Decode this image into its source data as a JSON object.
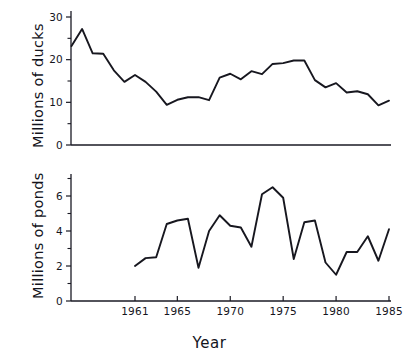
{
  "figure": {
    "background": "#ffffff",
    "ink_color": "#17171f",
    "xlabel": "Year",
    "panels": [
      "ducks",
      "ponds"
    ]
  },
  "chart_data": [
    {
      "type": "line",
      "panel": "top",
      "title": "",
      "xlabel": "",
      "ylabel": "Millions of ducks",
      "xlim": [
        1955,
        1985
      ],
      "ylim": [
        0,
        30
      ],
      "ytick_labels": [
        "0",
        "10",
        "20",
        "30"
      ],
      "yticks": [
        0,
        10,
        20,
        30
      ],
      "yticks_minor": [
        5,
        15,
        25
      ],
      "xtick_labels": [
        "1961",
        "1965",
        "1970",
        "1975",
        "1980",
        "1985"
      ],
      "xticks": [
        1961,
        1965,
        1970,
        1975,
        1980,
        1985
      ],
      "grid": false,
      "legend": false,
      "series": [
        {
          "name": "Millions of ducks",
          "x": [
            1955,
            1956,
            1957,
            1958,
            1959,
            1960,
            1961,
            1962,
            1963,
            1964,
            1965,
            1966,
            1967,
            1968,
            1969,
            1970,
            1971,
            1972,
            1973,
            1974,
            1975,
            1976,
            1977,
            1978,
            1979,
            1980,
            1981,
            1982,
            1983,
            1984,
            1985
          ],
          "values": [
            23.2,
            27.2,
            21.5,
            21.4,
            17.5,
            14.8,
            16.4,
            14.8,
            12.5,
            9.4,
            10.6,
            11.2,
            11.2,
            10.5,
            15.8,
            16.7,
            15.4,
            17.3,
            16.6,
            19.0,
            19.2,
            19.8,
            19.8,
            15.2,
            13.5,
            14.5,
            12.3,
            12.6,
            11.9,
            9.3,
            10.4
          ]
        }
      ]
    },
    {
      "type": "line",
      "panel": "bottom",
      "title": "",
      "xlabel": "Year",
      "ylabel": "Millions of ponds",
      "xlim": [
        1955,
        1985
      ],
      "ylim": [
        0,
        7
      ],
      "ytick_labels": [
        "0",
        "2",
        "4",
        "6"
      ],
      "yticks": [
        0,
        2,
        4,
        6
      ],
      "yticks_minor": [
        1,
        3,
        5,
        7
      ],
      "xtick_labels": [
        "1961",
        "1965",
        "1970",
        "1975",
        "1980",
        "1985"
      ],
      "xticks": [
        1961,
        1965,
        1970,
        1975,
        1980,
        1985
      ],
      "grid": false,
      "legend": false,
      "series": [
        {
          "name": "Millions of ponds",
          "x": [
            1961,
            1962,
            1963,
            1964,
            1965,
            1966,
            1967,
            1968,
            1969,
            1970,
            1971,
            1972,
            1973,
            1974,
            1975,
            1976,
            1977,
            1978,
            1979,
            1980,
            1981,
            1982,
            1983,
            1984,
            1985
          ],
          "values": [
            2.0,
            2.45,
            2.5,
            4.4,
            4.6,
            4.7,
            1.9,
            4.0,
            4.9,
            4.3,
            4.2,
            3.1,
            6.1,
            6.5,
            5.9,
            2.4,
            4.5,
            4.6,
            2.2,
            1.5,
            2.8,
            2.8,
            3.7,
            2.3,
            4.1
          ]
        }
      ]
    }
  ]
}
